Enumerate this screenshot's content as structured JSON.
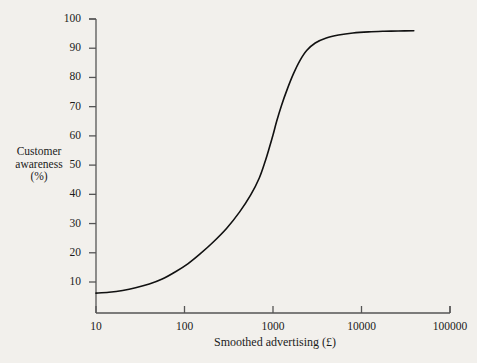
{
  "chart_data": {
    "type": "line",
    "title": "",
    "xlabel": "Smoothed advertising (£)",
    "ylabel": "Customer awareness (%)",
    "ylabel_lines": [
      "Customer",
      "awareness",
      "(%)"
    ],
    "xscale": "log",
    "yscale": "linear",
    "xlim": [
      10,
      100000
    ],
    "ylim": [
      2.5,
      102
    ],
    "grid": false,
    "legend": null,
    "xticks": [
      10,
      100,
      1000,
      10000,
      100000
    ],
    "xtick_labels": [
      "10",
      "100",
      "1000",
      "10000",
      "100000"
    ],
    "yticks": [
      10,
      20,
      30,
      40,
      50,
      60,
      70,
      80,
      90,
      100
    ],
    "ytick_labels": [
      "10",
      "20",
      "30",
      "40",
      "50",
      "60",
      "70",
      "80",
      "90",
      "100"
    ],
    "series": [
      {
        "name": "Customer awareness response curve",
        "color": "#111111",
        "linewidth": 1.6,
        "x": [
          10,
          14,
          20,
          28,
          40,
          56,
          80,
          110,
          150,
          210,
          300,
          420,
          560,
          700,
          820,
          900,
          1000,
          1100,
          1250,
          1450,
          1700,
          2000,
          2400,
          3000,
          4000,
          5500,
          8000,
          12000,
          18000,
          26000,
          39000
        ],
        "y": [
          6.2,
          6.5,
          7.1,
          8.0,
          9.3,
          11.0,
          13.6,
          16.3,
          19.6,
          23.6,
          28.4,
          34.0,
          39.8,
          45.6,
          51.5,
          55.5,
          60.3,
          65.0,
          70.5,
          76.0,
          81.2,
          85.6,
          89.2,
          91.8,
          93.5,
          94.5,
          95.2,
          95.6,
          95.8,
          95.9,
          96.0
        ]
      }
    ],
    "annotations": [],
    "notes": {
      "start_value": 6.2,
      "saturation_value": 96.0,
      "inflection_x": 810,
      "inflection_y": 50
    }
  },
  "axes": {
    "x_axis_name": "smoothed-advertising-axis",
    "y_axis_name": "customer-awareness-axis"
  },
  "colors": {
    "background": "#f2f0ec",
    "axis": "#555555",
    "text": "#1b1b1b",
    "curve": "#111111"
  }
}
